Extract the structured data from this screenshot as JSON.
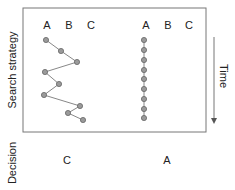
{
  "labels": {
    "y_top": "Search strategy",
    "y_bottom": "Decision",
    "time": "Time"
  },
  "left_panel": {
    "options": [
      "A",
      "B",
      "C"
    ],
    "decision": "C",
    "path": [
      [
        46,
        40
      ],
      [
        61,
        51
      ],
      [
        77,
        62
      ],
      [
        45,
        72
      ],
      [
        59,
        84
      ],
      [
        44,
        95
      ],
      [
        80,
        106
      ],
      [
        68,
        113
      ],
      [
        83,
        120
      ]
    ]
  },
  "right_panel": {
    "options": [
      "A",
      "B",
      "C"
    ],
    "decision": "A",
    "path": [
      [
        144,
        40
      ],
      [
        144,
        50
      ],
      [
        144,
        60
      ],
      [
        144,
        70
      ],
      [
        144,
        79
      ],
      [
        144,
        89
      ],
      [
        144,
        99
      ],
      [
        144,
        109
      ],
      [
        144,
        118
      ]
    ]
  },
  "colors": {
    "frame": "#777777",
    "line": "#888888",
    "dot": "#9a9a9a",
    "dot_stroke": "#666666"
  }
}
